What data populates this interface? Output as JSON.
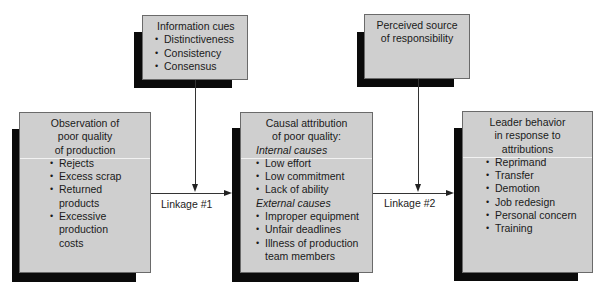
{
  "diagram": {
    "info_cues": {
      "title": "Information cues",
      "items": [
        "Distinctiveness",
        "Consistency",
        "Consensus"
      ]
    },
    "perceived_source": {
      "title_line1": "Perceived source",
      "title_line2": "of responsibility"
    },
    "observation": {
      "title_line1": "Observation of",
      "title_line2": "poor quality",
      "title_line3": "of production",
      "items": [
        "Rejects",
        "Excess scrap",
        "Returned products",
        "Excessive production costs"
      ]
    },
    "causal_attribution": {
      "title_line1": "Causal attribution",
      "title_line2": "of poor quality:",
      "internal_heading": "Internal causes",
      "internal_items": [
        "Low effort",
        "Low commitment",
        "Lack of ability"
      ],
      "external_heading": "External causes",
      "external_items": [
        "Improper equipment",
        "Unfair deadlines",
        "Illness of production team members"
      ]
    },
    "leader_behavior": {
      "title_line1": "Leader behavior",
      "title_line2": "in response to",
      "title_line3": "attributions",
      "items": [
        "Reprimand",
        "Transfer",
        "Demotion",
        "Job redesign",
        "Personal concern",
        "Training"
      ]
    },
    "linkages": {
      "linkage1": "Linkage #1",
      "linkage2": "Linkage #2"
    },
    "colors": {
      "box_fill": "#cfcfcf",
      "shadow": "#0a0a0a",
      "divider": "#f2f2f2"
    }
  }
}
